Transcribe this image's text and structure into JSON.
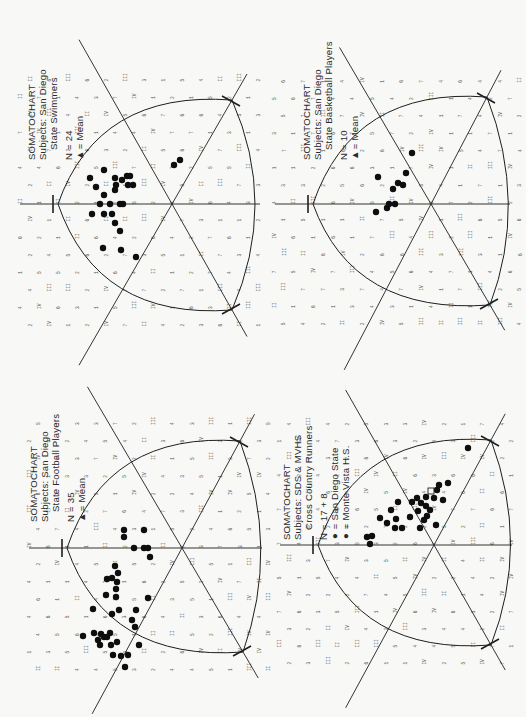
{
  "page": {
    "background": "#f8f8f6",
    "ink": "#1e1e1e"
  },
  "charts": [
    {
      "id": "swimmers",
      "title": "SOMATOCHART",
      "subjects_line": "Subjects: San Diego",
      "subjects_line2": "State Swimmers",
      "n_label": "N = 24",
      "legend": [
        {
          "symbol": "▲",
          "label": "= Mean"
        }
      ],
      "caption_pos": {
        "x": 26,
        "y": 160
      },
      "geometry": {
        "apex": [
          58,
          204
        ],
        "center": [
          172,
          204
        ],
        "top_corner": [
          232,
          100
        ],
        "bottom_corner": [
          232,
          310
        ],
        "right_edge": [
          260,
          204
        ]
      },
      "dots": [
        [
          90,
          178
        ],
        [
          96,
          187
        ],
        [
          104,
          170
        ],
        [
          115,
          178
        ],
        [
          116,
          185
        ],
        [
          122,
          180
        ],
        [
          128,
          185
        ],
        [
          127,
          176
        ],
        [
          115,
          190
        ],
        [
          130,
          176
        ],
        [
          133,
          185
        ],
        [
          104,
          195
        ],
        [
          100,
          204
        ],
        [
          110,
          204
        ],
        [
          120,
          204
        ],
        [
          123,
          204
        ],
        [
          92,
          214
        ],
        [
          104,
          214
        ],
        [
          112,
          214
        ],
        [
          115,
          223
        ],
        [
          120,
          231
        ],
        [
          103,
          248
        ],
        [
          121,
          250
        ],
        [
          136,
          257
        ],
        [
          174,
          165
        ],
        [
          180,
          160
        ]
      ],
      "means": []
    },
    {
      "id": "basketball",
      "title": "SOMATOCHART",
      "subjects_line": "Subjects: San Diego",
      "subjects_line2": "State Basketball Players",
      "n_label": "N = 10",
      "legend": [
        {
          "symbol": "▲",
          "label": "= Mean"
        }
      ],
      "caption_pos": {
        "x": 301,
        "y": 160
      },
      "geometry": {
        "apex": [
          313,
          204
        ],
        "center": [
          431,
          204
        ],
        "top_corner": [
          487,
          97
        ],
        "bottom_corner": [
          490,
          305
        ],
        "right_edge": [
          510,
          204
        ]
      },
      "dots": [
        [
          378,
          177
        ],
        [
          398,
          183
        ],
        [
          403,
          185
        ],
        [
          406,
          173
        ],
        [
          393,
          189
        ],
        [
          376,
          212
        ],
        [
          387,
          208
        ],
        [
          389,
          204
        ],
        [
          395,
          204
        ],
        [
          412,
          153
        ]
      ],
      "means": []
    },
    {
      "id": "football",
      "title": "SOMATOCHART",
      "subjects_line": "Subjects: San Diego",
      "subjects_line2": "State Football Players",
      "n_label": "N = 35",
      "legend": [
        {
          "symbol": "▲",
          "label": "= Mean"
        }
      ],
      "caption_pos": {
        "x": 28,
        "y": 522
      },
      "geometry": {
        "apex": [
          67,
          548
        ],
        "center": [
          182,
          548
        ],
        "top_corner": [
          240,
          441
        ],
        "bottom_corner": [
          243,
          652
        ],
        "right_edge": [
          262,
          548
        ]
      },
      "dots": [
        [
          124,
          530
        ],
        [
          124,
          537
        ],
        [
          144,
          530
        ],
        [
          134,
          548
        ],
        [
          144,
          548
        ],
        [
          148,
          548
        ],
        [
          150,
          557
        ],
        [
          115,
          566
        ],
        [
          118,
          573
        ],
        [
          112,
          578
        ],
        [
          117,
          582
        ],
        [
          107,
          579
        ],
        [
          116,
          589
        ],
        [
          106,
          595
        ],
        [
          116,
          597
        ],
        [
          119,
          610
        ],
        [
          112,
          614
        ],
        [
          93,
          609
        ],
        [
          94,
          633
        ],
        [
          83,
          636
        ],
        [
          101,
          634
        ],
        [
          110,
          633
        ],
        [
          104,
          637
        ],
        [
          100,
          645
        ],
        [
          98,
          640
        ],
        [
          107,
          637
        ],
        [
          111,
          645
        ],
        [
          117,
          642
        ],
        [
          113,
          655
        ],
        [
          121,
          656
        ],
        [
          132,
          620
        ],
        [
          135,
          627
        ],
        [
          128,
          655
        ],
        [
          139,
          645
        ],
        [
          136,
          610
        ],
        [
          148,
          598
        ],
        [
          125,
          667
        ]
      ],
      "means": []
    },
    {
      "id": "cross-country",
      "title": "SOMATOCHART",
      "subjects_line": "Subjects: SDS & MVHS",
      "subjects_line2": "Cross Country Runners",
      "n_label": "N = 17 + 8",
      "legend": [
        {
          "symbol": "●",
          "label": "= San Diego State"
        },
        {
          "symbol": "●",
          "label": "= Monte Vista H.S."
        }
      ],
      "caption_pos": {
        "x": 281,
        "y": 540
      },
      "geometry": {
        "apex": [
          318,
          545
        ],
        "center": [
          434,
          545
        ],
        "top_corner": [
          491,
          440
        ],
        "bottom_corner": [
          491,
          645
        ],
        "right_edge": [
          512,
          545
        ]
      },
      "dots": [
        [
          367,
          537
        ],
        [
          372,
          536
        ],
        [
          370,
          544
        ],
        [
          380,
          518
        ],
        [
          387,
          523
        ],
        [
          391,
          510
        ],
        [
          396,
          519
        ],
        [
          395,
          528
        ],
        [
          398,
          502
        ],
        [
          402,
          528
        ],
        [
          410,
          517
        ],
        [
          417,
          498
        ],
        [
          418,
          511
        ],
        [
          412,
          502
        ],
        [
          421,
          503
        ],
        [
          426,
          506
        ],
        [
          424,
          520
        ],
        [
          420,
          528
        ],
        [
          427,
          516
        ],
        [
          426,
          497
        ],
        [
          430,
          510
        ],
        [
          434,
          498
        ],
        [
          437,
          490
        ],
        [
          439,
          485
        ],
        [
          436,
          525
        ],
        [
          443,
          500
        ],
        [
          448,
          483
        ],
        [
          468,
          448
        ]
      ],
      "means": [
        [
          431,
          491
        ]
      ]
    }
  ],
  "grid_label_glyphs": [
    "1",
    "2",
    "3",
    "4",
    "5",
    "6",
    "7",
    "II",
    "III",
    "IV"
  ]
}
